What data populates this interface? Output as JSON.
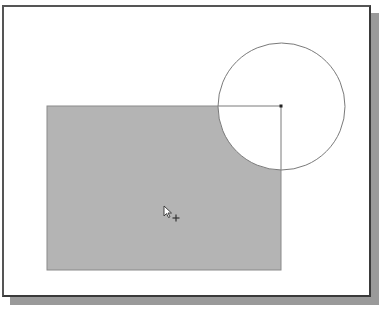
{
  "canvas": {
    "width": 381,
    "height": 312,
    "background": "#ffffff"
  },
  "frame": {
    "x": 2,
    "y": 5,
    "width": 369,
    "height": 292,
    "fill": "#ffffff",
    "border_color": "#3a3a3a",
    "shadow_color": "#9a9a9a"
  },
  "shapes": {
    "rectangle": {
      "x": 47,
      "y": 106,
      "width": 234,
      "height": 164,
      "fill": "#b4b4b4",
      "stroke": "#8a8a8a"
    },
    "circle": {
      "cx": 281,
      "cy": 106,
      "r": 64,
      "fill": "#ffffff",
      "stroke": "#7a7a7a"
    },
    "center_point": {
      "x": 281,
      "y": 106,
      "color": "#222222"
    },
    "radius_line": {
      "x1": 218,
      "y1": 106,
      "x2": 281,
      "y2": 106,
      "stroke": "#7a7a7a"
    }
  },
  "cursor": {
    "icon": "arrow-with-crosshair-icon",
    "x": 163,
    "y": 205
  }
}
